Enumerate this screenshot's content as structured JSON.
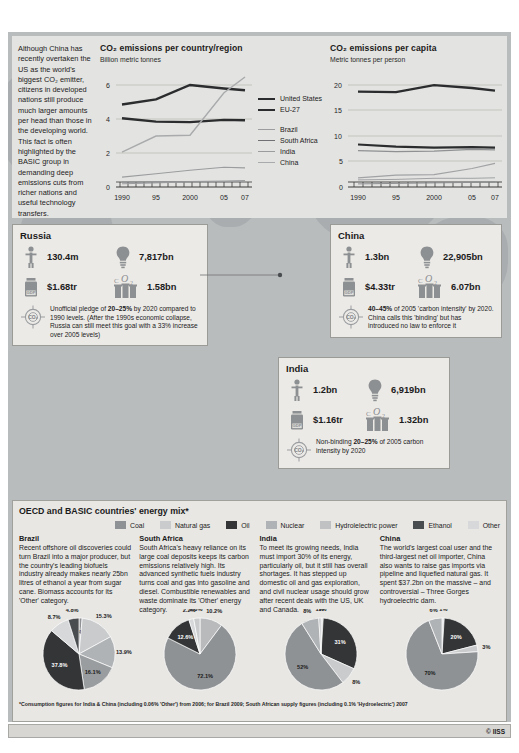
{
  "intro": {
    "text": "Although China has recently overtaken the US as the world's biggest CO₂ emitter, citizens in developed nations still produce much larger amounts per head than those in the developing world. This fact is often highlighted by the BASIC group in demanding deep emissions cuts from richer nations and useful technology transfers."
  },
  "colors": {
    "panel_bg": "#e3e3e1",
    "map_bg": "#b9bcbd",
    "land": "#a9adaf",
    "coal": "#8f9295",
    "natural_gas": "#c9cbcc",
    "oil": "#333536",
    "nuclear": "#b0b3b5",
    "hydro": "#bfc1c3",
    "ethanol": "#4a4d4f",
    "other": "#d6d8d9"
  },
  "chart_data": [
    {
      "type": "line",
      "title": "CO₂ emissions per country/region",
      "subtitle": "Billion metric tonnes",
      "ylabel": "Billion metric tonnes",
      "xlabel": "",
      "x": [
        1990,
        1995,
        2000,
        2005,
        2007
      ],
      "xticklabels": [
        "1990",
        "95",
        "2000",
        "05",
        "07"
      ],
      "yticklabels": [
        "0",
        "2",
        "4",
        "6"
      ],
      "ylim": [
        0,
        6.6
      ],
      "grid": true,
      "legend_position": "right",
      "series": [
        {
          "name": "United States",
          "values": [
            4.85,
            5.15,
            6.0,
            5.85,
            5.75
          ],
          "style": "thick"
        },
        {
          "name": "EU-27",
          "values": [
            4.05,
            3.85,
            3.82,
            3.95,
            3.93
          ],
          "style": "thick"
        },
        {
          "name": "Brazil",
          "values": [
            0.19,
            0.24,
            0.3,
            0.32,
            0.35
          ],
          "style": "thin"
        },
        {
          "name": "South Africa",
          "values": [
            0.29,
            0.3,
            0.32,
            0.35,
            0.37
          ],
          "style": "thin"
        },
        {
          "name": "India",
          "values": [
            0.58,
            0.78,
            0.98,
            1.16,
            1.12
          ],
          "style": "thin"
        },
        {
          "name": "China",
          "values": [
            2.05,
            3.0,
            3.05,
            5.55,
            6.45
          ],
          "style": "thin"
        }
      ]
    },
    {
      "type": "line",
      "title": "CO₂ emissions per capita",
      "subtitle": "Metric tonnes per person",
      "ylabel": "Metric tonnes per person",
      "xlabel": "",
      "x": [
        1990,
        1995,
        2000,
        2005,
        2007
      ],
      "xticklabels": [
        "1990",
        "95",
        "2000",
        "05",
        "07"
      ],
      "yticklabels": [
        "0",
        "5",
        "10",
        "15",
        "20"
      ],
      "ylim": [
        0,
        21.5
      ],
      "grid": true,
      "legend_position": "none",
      "series": [
        {
          "name": "United States",
          "values": [
            19.1,
            19.0,
            20.0,
            19.4,
            18.9
          ],
          "style": "thick"
        },
        {
          "name": "South Africa",
          "values": [
            8.4,
            8.0,
            7.8,
            7.9,
            7.8
          ],
          "style": "thick"
        },
        {
          "name": "EU-27",
          "values": [
            7.2,
            7.0,
            7.1,
            7.4,
            7.3
          ],
          "style": "thin"
        },
        {
          "name": "China",
          "values": [
            1.8,
            2.3,
            2.4,
            3.6,
            4.6
          ],
          "style": "thin"
        },
        {
          "name": "Brazil",
          "values": [
            1.4,
            1.5,
            1.7,
            1.7,
            1.8
          ],
          "style": "thin"
        },
        {
          "name": "India",
          "values": [
            0.6,
            0.7,
            0.8,
            0.9,
            1.0
          ],
          "style": "thin"
        }
      ]
    }
  ],
  "countries": [
    {
      "name": "Russia",
      "population": "130.4m",
      "energy": "7,817bn",
      "gdp": "$1.68tr",
      "co2": "1.58bn",
      "pledge_pre": "Unofficial pledge of ",
      "pledge_bold": "20–25%",
      "pledge_post": " by 2020 compared to 1990 levels. (After the 1990s economic collapse, Russia can still meet this goal with a 33% increase over 2005 levels)"
    },
    {
      "name": "China",
      "population": "1.3bn",
      "energy": "22,905bn",
      "gdp": "$4.33tr",
      "co2": "6.07bn",
      "pledge_pre": "",
      "pledge_bold": "40–45%",
      "pledge_post": " of 2005 'carbon intensity' by 2020. China calls this 'binding' but has introduced no law to enforce it"
    },
    {
      "name": "India",
      "population": "1.2bn",
      "energy": "6,919bn",
      "gdp": "$1.16tr",
      "co2": "1.32bn",
      "pledge_pre": "Non-binding ",
      "pledge_bold": "20–25%",
      "pledge_post": " of 2005 carbon intensity by 2020"
    }
  ],
  "energy_mix": {
    "title": "OECD and BASIC countries' energy mix*",
    "legend": [
      {
        "label": "Coal",
        "color": "#8f9295"
      },
      {
        "label": "Natural gas",
        "color": "#c9cbcc"
      },
      {
        "label": "Oil",
        "color": "#333536"
      },
      {
        "label": "Nuclear",
        "color": "#b0b3b5"
      },
      {
        "label": "Hydrolelectric power",
        "color": "#bfc1c3"
      },
      {
        "label": "Ethanol",
        "color": "#4a4d4f"
      },
      {
        "label": "Other",
        "color": "#d6d8d9"
      }
    ],
    "columns": [
      {
        "name": "Brazil",
        "text": "Recent offshore oil discoveries could turn Brazil into a major producer, but the country's leading biofuels industry already makes nearly 25bn litres of ethanol a year from sugar cane. Biomass accounts for its 'Other' category."
      },
      {
        "name": "South Africa",
        "text": "South Africa's heavy reliance on its large coal deposits keeps its carbon emissions relatively high. Its advanced synthetic fuels industry turns coal and gas into gasoline and diesel. Combustible renewables and waste dominate its 'Other' energy category."
      },
      {
        "name": "India",
        "text": "To meet its growing needs, India must import 30% of its energy, particularly oil, but it still has overall shortages. It has stepped up domestic oil and gas exploration, and civil nuclear usage should grow after recent deals with the US, UK and Canada."
      },
      {
        "name": "China",
        "text": "The world's largest coal user and the third-largest net oil importer, China also wants to raise gas imports via pipeline and liquefied natural gas. It spent $37.2bn on the massive – and controversial – Three Gorges hydroelectric dam."
      }
    ],
    "pies": [
      {
        "country": "Brazil",
        "type": "pie",
        "slices": [
          {
            "label": "1.4%",
            "value": 1.4,
            "color": "#8f9295"
          },
          {
            "label": "15.3%",
            "value": 15.3,
            "color": "#c9cbcc"
          },
          {
            "label": "13.9%",
            "value": 13.9,
            "color": "#b0b3b5"
          },
          {
            "label": "16.1%",
            "value": 16.1,
            "color": "#9a9d9f"
          },
          {
            "label": "37.8%",
            "value": 37.8,
            "color": "#333536"
          },
          {
            "label": "8.7%",
            "value": 8.7,
            "color": "#d6d8d9"
          },
          {
            "label": "4.8%",
            "value": 4.8,
            "color": "#4a4d4f"
          }
        ]
      },
      {
        "country": "South Africa",
        "type": "pie",
        "slices": [
          {
            "label": "10.2%",
            "value": 10.2,
            "color": "#b8babc"
          },
          {
            "label": "72.1%",
            "value": 72.1,
            "color": "#8f9295"
          },
          {
            "label": "12.6%",
            "value": 12.6,
            "color": "#333536"
          },
          {
            "label": "2.2%",
            "value": 2.2,
            "color": "#d6d8d9"
          },
          {
            "label": "2.8%",
            "value": 2.8,
            "color": "#c9cbcc"
          }
        ]
      },
      {
        "country": "India",
        "type": "pie",
        "slices": [
          {
            "label": "1%",
            "value": 1,
            "color": "#d6d8d9"
          },
          {
            "label": "31%",
            "value": 31,
            "color": "#333536"
          },
          {
            "label": "8%",
            "value": 8,
            "color": "#c9cbcc"
          },
          {
            "label": "52%",
            "value": 52,
            "color": "#8f9295"
          },
          {
            "label": "8%",
            "value": 8,
            "color": "#b0b3b5"
          },
          {
            "label": "1%",
            "value": 1,
            "color": "#bfc1c3"
          }
        ]
      },
      {
        "country": "China",
        "type": "pie",
        "slices": [
          {
            "label": "1%",
            "value": 1,
            "color": "#d6d8d9"
          },
          {
            "label": "20%",
            "value": 20,
            "color": "#333536"
          },
          {
            "label": "3%",
            "value": 3,
            "color": "#c9cbcc"
          },
          {
            "label": "70%",
            "value": 70,
            "color": "#8f9295"
          },
          {
            "label": "6%",
            "value": 6,
            "color": "#b0b3b5"
          }
        ]
      }
    ],
    "footnote": "*Consumption figures for India & China (including 0.06% 'Other') from 2006; for Brazil 2009; South African supply figures (including 0.1% 'Hydroelectric') 2007"
  },
  "credit": "© IISS"
}
